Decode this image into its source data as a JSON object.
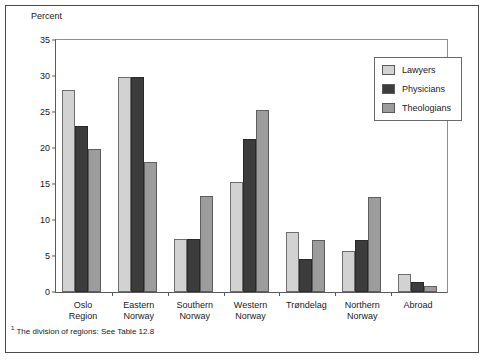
{
  "figure": {
    "axis_caption": "Percent",
    "footnote_marker": "1",
    "footnote": "The division of regions: See Table 12.8"
  },
  "legend": {
    "items": [
      {
        "label": "Lawyers",
        "color": "#d2d2d2"
      },
      {
        "label": "Physicians",
        "color": "#3c3c3c"
      },
      {
        "label": "Theologians",
        "color": "#9c9c9c"
      }
    ]
  },
  "chart_data": {
    "type": "bar",
    "title": "",
    "xlabel": "",
    "ylabel": "Percent",
    "ylim": [
      0,
      35
    ],
    "yticks": [
      0,
      5,
      10,
      15,
      20,
      25,
      30,
      35
    ],
    "ytick_labels": [
      "0",
      "5",
      "10",
      "15",
      "20",
      "25",
      "30",
      "35"
    ],
    "grid": false,
    "legend_position": "top-right",
    "categories": [
      "Oslo Region",
      "Eastern Norway",
      "Southern Norway",
      "Western Norway",
      "Trøndelag",
      "Northern Norway",
      "Abroad"
    ],
    "category_lines": [
      [
        "Oslo",
        "Region"
      ],
      [
        "Eastern",
        "Norway"
      ],
      [
        "Southern",
        "Norway"
      ],
      [
        "Western",
        "Norway"
      ],
      [
        "Trøndelag"
      ],
      [
        "Northern",
        "Norway"
      ],
      [
        "Abroad"
      ]
    ],
    "series": [
      {
        "name": "Lawyers",
        "color": "#d2d2d2",
        "values": [
          28.1,
          29.9,
          7.3,
          15.3,
          8.4,
          5.7,
          2.5
        ]
      },
      {
        "name": "Physicians",
        "color": "#3c3c3c",
        "values": [
          23.0,
          29.9,
          7.4,
          21.2,
          4.6,
          7.2,
          1.4
        ]
      },
      {
        "name": "Theologians",
        "color": "#9c9c9c",
        "values": [
          19.9,
          18.0,
          13.3,
          25.3,
          7.2,
          13.2,
          0.8
        ]
      }
    ]
  }
}
